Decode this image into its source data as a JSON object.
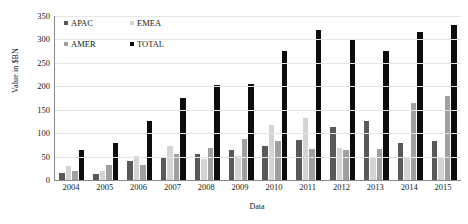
{
  "chart_data": {
    "type": "bar",
    "title": "",
    "xlabel": "Data",
    "ylabel": "Value in $BN",
    "ylim": [
      0,
      350
    ],
    "ytick_step": 50,
    "yticks": [
      0,
      50,
      100,
      150,
      200,
      250,
      300,
      350
    ],
    "grid": true,
    "legend_position": "top-left-inside",
    "categories": [
      "2004",
      "2005",
      "2006",
      "2007",
      "2008",
      "2009",
      "2010",
      "2011",
      "2012",
      "2013",
      "2014",
      "2015"
    ],
    "series": [
      {
        "name": "APAC",
        "color": "#595959",
        "values": [
          14,
          12,
          40,
          48,
          55,
          63,
          73,
          85,
          113,
          126,
          78,
          83
        ]
      },
      {
        "name": "EMEA",
        "color": "#d4d4d4",
        "values": [
          30,
          20,
          52,
          73,
          45,
          52,
          118,
          133,
          68,
          48,
          47,
          50
        ]
      },
      {
        "name": "AMER",
        "color": "#a0a0a0",
        "values": [
          20,
          31,
          33,
          55,
          68,
          87,
          84,
          66,
          63,
          67,
          165,
          180
        ]
      },
      {
        "name": "TOTAL",
        "color": "#0d0d0d",
        "values": [
          65,
          80,
          127,
          175,
          203,
          204,
          276,
          320,
          298,
          275,
          315,
          330
        ]
      }
    ]
  },
  "legend": {
    "items": [
      {
        "label": "APAC"
      },
      {
        "label": "EMEA"
      },
      {
        "label": "AMER"
      },
      {
        "label": "TOTAL"
      }
    ]
  }
}
